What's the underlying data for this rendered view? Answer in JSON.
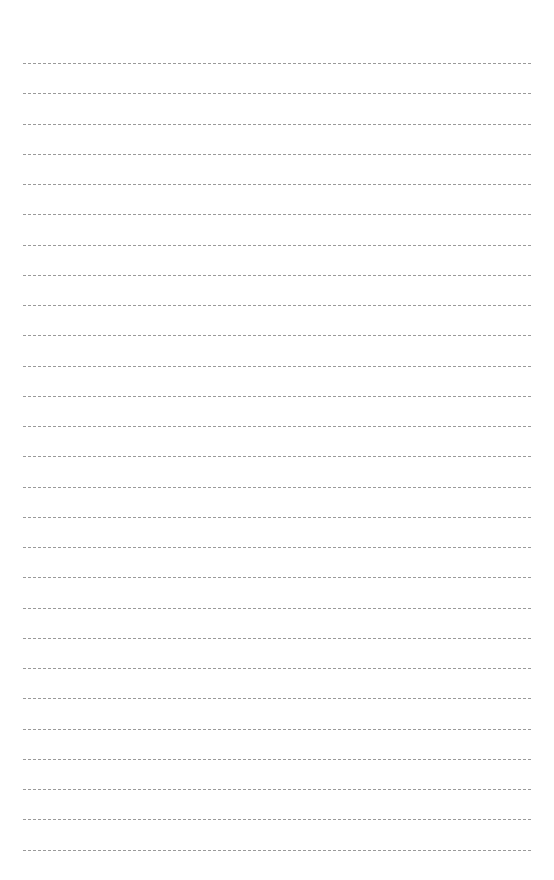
{
  "page": {
    "type": "lined-paper",
    "background": "#ffffff",
    "line_color": "#9a9a9a",
    "line_style": "dashed",
    "line_count": 27,
    "first_line_y": 63,
    "line_spacing": 30.25,
    "line_left": 23,
    "line_width": 508
  }
}
